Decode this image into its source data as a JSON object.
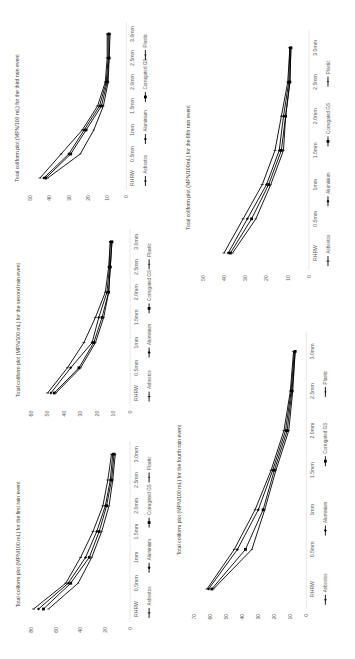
{
  "figure": {
    "rotation_deg": -90,
    "background": "#ffffff",
    "line_color": "#000000"
  },
  "chart_data": [
    {
      "id": "third",
      "type": "line",
      "title": "Total coliform plot (MPN/100 mL) for the third rain event",
      "xlabel": "",
      "ylabel": "",
      "categories": [
        "RHRW",
        "0.5mm",
        "1mm",
        "1.5mm",
        "2.0mm",
        "2.5mm",
        "3.0mm"
      ],
      "yticks": [
        0,
        10,
        20,
        30,
        40,
        50
      ],
      "ylim": [
        0,
        50
      ],
      "series": [
        {
          "name": "Asbestos",
          "marker": "plus",
          "values": [
            45,
            34,
            23,
            15,
            11,
            10,
            10
          ]
        },
        {
          "name": "Aluminium",
          "marker": "diamond",
          "values": [
            43,
            30,
            22,
            14,
            10.5,
            9.5,
            9.5
          ]
        },
        {
          "name": "Corrugated GS",
          "marker": "square",
          "values": [
            42,
            29,
            21,
            13,
            10,
            9,
            9
          ]
        },
        {
          "name": "Plastic",
          "marker": "dash",
          "values": [
            41,
            24,
            17,
            12,
            9.5,
            9,
            8.5
          ]
        }
      ],
      "legend_position": "bottom",
      "grid": false,
      "box": {
        "left": 8,
        "top": 18,
        "width": 160,
        "height": 200
      }
    },
    {
      "id": "second",
      "type": "line",
      "title": "Total coliform plot (MPN/100 mL) for the second rain event",
      "xlabel": "",
      "ylabel": "",
      "categories": [
        "RHRW",
        "0.5mm",
        "1mm",
        "1.5mm",
        "2.0mm",
        "2.5mm",
        "3.0mm"
      ],
      "yticks": [
        0,
        10,
        20,
        30,
        40,
        50,
        60
      ],
      "ylim": [
        0,
        60
      ],
      "series": [
        {
          "name": "Asbestos",
          "marker": "plus",
          "values": [
            50,
            38,
            28,
            21,
            15,
            13,
            12
          ]
        },
        {
          "name": "Aluminium",
          "marker": "diamond",
          "values": [
            48,
            36,
            23,
            19,
            14,
            12.5,
            12
          ]
        },
        {
          "name": "Corrugated GS",
          "marker": "square",
          "values": [
            46,
            31,
            22,
            17,
            13,
            12,
            11
          ]
        },
        {
          "name": "Plastic",
          "marker": "dash",
          "values": [
            45,
            30,
            21,
            16,
            13,
            12,
            11
          ]
        }
      ],
      "legend_position": "bottom",
      "grid": false,
      "box": {
        "left": 8,
        "top": 225,
        "width": 165,
        "height": 210
      }
    },
    {
      "id": "first",
      "type": "line",
      "title": "Total coliform plot (MPN/100 mL) for the first rain event",
      "xlabel": "",
      "ylabel": "",
      "categories": [
        "RHRW",
        "0.5mm",
        "1mm",
        "1.5mm",
        "2.0mm",
        "2.5mm",
        "3.0mm"
      ],
      "yticks": [
        0,
        20,
        40,
        60,
        80
      ],
      "ylim": [
        0,
        80
      ],
      "series": [
        {
          "name": "Asbestos",
          "marker": "plus",
          "values": [
            78,
            52,
            40,
            30,
            22,
            18,
            15
          ]
        },
        {
          "name": "Aluminium",
          "marker": "diamond",
          "values": [
            74,
            50,
            36,
            27,
            20,
            16,
            14
          ]
        },
        {
          "name": "Corrugated GS",
          "marker": "square",
          "values": [
            70,
            48,
            33,
            25,
            19,
            15,
            13
          ]
        },
        {
          "name": "Plastic",
          "marker": "dash",
          "values": [
            66,
            42,
            31,
            23,
            17,
            14,
            12
          ]
        }
      ],
      "legend_position": "bottom",
      "grid": false,
      "box": {
        "left": 8,
        "top": 437,
        "width": 165,
        "height": 215
      }
    },
    {
      "id": "fifth",
      "type": "line",
      "title": "Total coliform plot (MPN/100mL) for the fifth rain event",
      "xlabel": "",
      "ylabel": "",
      "categories": [
        "RHRW",
        "0.5mm",
        "1mm",
        "1.5mm",
        "2.0mm",
        "2.5mm",
        "3.0mm"
      ],
      "yticks": [
        0,
        10,
        20,
        30,
        40,
        50
      ],
      "ylim": [
        0,
        50
      ],
      "series": [
        {
          "name": "Asbestos",
          "marker": "plus",
          "values": [
            40,
            31,
            22,
            16,
            13,
            10,
            9
          ]
        },
        {
          "name": "Aluminium",
          "marker": "diamond",
          "values": [
            38,
            29,
            20,
            14,
            12,
            9.5,
            9
          ]
        },
        {
          "name": "Corrugated GS",
          "marker": "square",
          "values": [
            37,
            27,
            19,
            13,
            11,
            9,
            8.5
          ]
        },
        {
          "name": "Plastic",
          "marker": "dash",
          "values": [
            36,
            25,
            18,
            12,
            11,
            9,
            8.5
          ]
        }
      ],
      "legend_position": "bottom",
      "grid": false,
      "box": {
        "left": 178,
        "top": 25,
        "width": 177,
        "height": 285
      }
    },
    {
      "id": "fourth",
      "type": "line",
      "title": "Total coliform plot (MPN/100 mL) for the fourth rain event",
      "xlabel": "",
      "ylabel": "",
      "categories": [
        "RHRW",
        "0.5mm",
        "1mm",
        "1.5mm",
        "2.0mm",
        "2.5mm",
        "3.0mm"
      ],
      "yticks": [
        0,
        10,
        20,
        30,
        40,
        50,
        60,
        70
      ],
      "ylim": [
        0,
        70
      ],
      "series": [
        {
          "name": "Asbestos",
          "marker": "plus",
          "values": [
            62,
            45,
            32,
            22,
            14,
            10,
            8
          ]
        },
        {
          "name": "Aluminium",
          "marker": "diamond",
          "values": [
            61,
            43,
            30,
            21,
            13,
            9.5,
            7.5
          ]
        },
        {
          "name": "Corrugated GS",
          "marker": "square",
          "values": [
            59,
            38,
            27,
            20,
            12,
            9,
            7
          ]
        },
        {
          "name": "Plastic",
          "marker": "dash",
          "values": [
            58,
            34,
            26,
            19,
            11,
            8.5,
            7
          ]
        }
      ],
      "legend_position": "bottom",
      "grid": false,
      "box": {
        "left": 168,
        "top": 325,
        "width": 187,
        "height": 330
      }
    }
  ]
}
